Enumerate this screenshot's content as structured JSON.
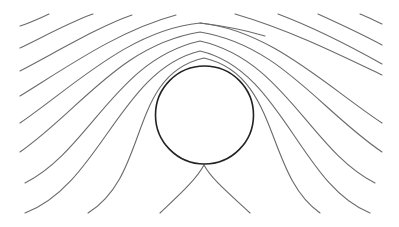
{
  "diagram": {
    "title": "",
    "colors": {
      "background": "#ffffff",
      "streamline": "#6a6a6a",
      "cylinder": "#222222"
    },
    "cylinder": {
      "cx": 204.5,
      "cy": 115,
      "r": 49
    },
    "streamlines": [
      {
        "id": "top-left-1",
        "d": "M 20 26 C 32 22, 40 18, 49 14"
      },
      {
        "id": "top-left-2",
        "d": "M 20 48 C 45 36, 70 22, 93 14"
      },
      {
        "id": "top-left-3",
        "d": "M 20 71 C 60 50, 100 26, 132 15"
      },
      {
        "id": "top-left-4",
        "d": "M 20 96 C 70 65, 120 30, 176 15"
      },
      {
        "id": "mid-left-5",
        "d": "M 20 123 C 75 85, 130 30, 200 23 C 270 30, 325 85, 382 123"
      },
      {
        "id": "mid-left-6",
        "d": "M 20 152 C 80 110, 120 45, 200 32 C 280 45, 320 110, 382 152"
      },
      {
        "id": "mid-left-7",
        "d": "M 25 183 C 90 150, 115 60, 200 41 C 285 60, 310 150, 375 183"
      },
      {
        "id": "mid-left-8",
        "d": "M 25 213 C 100 185, 120 70, 200 51 C 282 70, 300 185, 370 213"
      },
      {
        "id": "inner-9",
        "d": "M 88 213 C 150 175, 128 75, 204 58 C 280 75, 265 175, 320 213"
      },
      {
        "id": "top-right-1",
        "d": "M 235 14 C 290 30, 340 55, 382 75"
      },
      {
        "id": "top-right-2",
        "d": "M 278 14 C 315 28, 350 46, 382 64"
      },
      {
        "id": "top-right-3",
        "d": "M 318 14 C 340 24, 362 34, 382 45"
      },
      {
        "id": "top-right-4",
        "d": "M 360 14 C 368 17, 375 21, 382 24"
      },
      {
        "id": "top-center-right",
        "d": "M 200 23 C 225 26, 245 30, 265 36"
      },
      {
        "id": "cusp-left",
        "d": "M 160 213 C 178 196, 196 180, 204 165"
      },
      {
        "id": "cusp-right",
        "d": "M 250 213 C 232 196, 212 180, 204 165"
      }
    ]
  }
}
